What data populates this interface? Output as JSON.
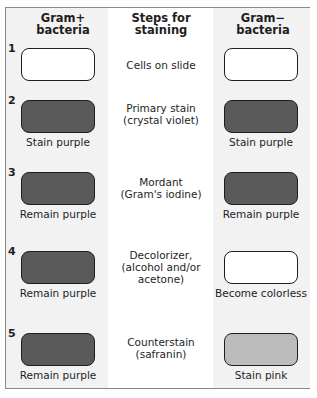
{
  "headers": {
    "left": [
      "Gram+",
      "bacteria"
    ],
    "middle": [
      "Steps for",
      "staining"
    ],
    "right": [
      "Gram−",
      "bacteria"
    ]
  },
  "colors": {
    "empty": "#ffffff",
    "purple": "#5a5a5a",
    "pink": "#bcbcbc",
    "border": "#1e1e1e",
    "column_bg": "#f2f2f2"
  },
  "steps": [
    {
      "number": "1",
      "step_lines": [
        "Cells on slide"
      ],
      "gram_pos": {
        "fill": "empty",
        "result": ""
      },
      "gram_neg": {
        "fill": "empty",
        "result": ""
      }
    },
    {
      "number": "2",
      "step_lines": [
        "Primary stain",
        "(crystal violet)"
      ],
      "gram_pos": {
        "fill": "purple",
        "result": "Stain purple"
      },
      "gram_neg": {
        "fill": "purple",
        "result": "Stain purple"
      }
    },
    {
      "number": "3",
      "step_lines": [
        "Mordant",
        "(Gram's iodine)"
      ],
      "gram_pos": {
        "fill": "purple",
        "result": "Remain purple"
      },
      "gram_neg": {
        "fill": "purple",
        "result": "Remain purple"
      }
    },
    {
      "number": "4",
      "step_lines": [
        "Decolorizer,",
        "(alcohol and/or",
        "acetone)"
      ],
      "gram_pos": {
        "fill": "purple",
        "result": "Remain purple"
      },
      "gram_neg": {
        "fill": "empty",
        "result": "Become colorless"
      }
    },
    {
      "number": "5",
      "step_lines": [
        "Counterstain",
        "(safranin)"
      ],
      "gram_pos": {
        "fill": "purple",
        "result": "Remain purple"
      },
      "gram_neg": {
        "fill": "pink",
        "result": "Stain pink"
      }
    }
  ]
}
